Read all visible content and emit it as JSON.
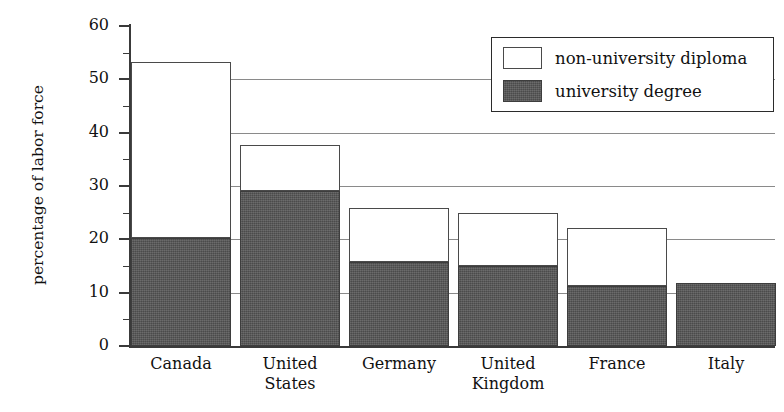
{
  "chart_data": {
    "type": "bar",
    "stacked": true,
    "title": "",
    "xlabel": "",
    "ylabel": "percentage of labor force",
    "ylim": [
      0,
      60
    ],
    "ytick_labels": [
      "0",
      "10",
      "20",
      "30",
      "40",
      "50",
      "60"
    ],
    "ytick_values": [
      0,
      10,
      20,
      30,
      40,
      50,
      60
    ],
    "yminor_values": [
      5,
      15,
      25,
      35,
      45,
      55
    ],
    "grid": "horizontal-major",
    "legend_position": "top-right",
    "categories": [
      "Canada",
      "United States",
      "Germany",
      "United Kingdom",
      "France",
      "Italy"
    ],
    "category_lines": [
      [
        "Canada"
      ],
      [
        "United",
        "States"
      ],
      [
        "Germany"
      ],
      [
        "United",
        "Kingdom"
      ],
      [
        "France"
      ],
      [
        "Italy"
      ]
    ],
    "series": [
      {
        "name": "university degree",
        "color": "#565656",
        "values": [
          20.2,
          29.1,
          15.7,
          15.0,
          11.3,
          11.8
        ]
      },
      {
        "name": "non-university diploma",
        "color": "#ffffff",
        "values": [
          33.1,
          8.6,
          10.1,
          10.0,
          10.9,
          0.0
        ]
      }
    ],
    "totals": [
      53.3,
      37.7,
      25.8,
      25.0,
      22.2,
      11.8
    ]
  },
  "legend": {
    "items": [
      {
        "label": "non-university diploma",
        "swatch": "white-swatch"
      },
      {
        "label": "university degree",
        "swatch": "dark-swatch"
      }
    ]
  },
  "colors": {
    "university_degree": "#565656",
    "non_university_diploma": "#ffffff",
    "axis": "#3a3a3a",
    "gridline": "#8a8a8a",
    "background": "#ffffff"
  }
}
